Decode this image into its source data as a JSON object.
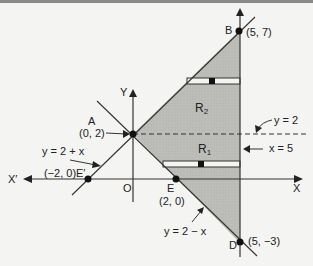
{
  "figure": {
    "axes": {
      "x_pos": "X",
      "x_neg": "X′",
      "y_pos": "Y",
      "origin": "O"
    },
    "points": {
      "A": {
        "name": "A",
        "coord": "(0, 2)"
      },
      "B": {
        "name": "B",
        "coord": "(5, 7)"
      },
      "D": {
        "name": "D",
        "coord": "(5, −3)"
      },
      "E": {
        "name": "E",
        "coord": "(2, 0)"
      },
      "E_prime": {
        "name": "E′",
        "coord": "(−2, 0)"
      }
    },
    "lines": {
      "l1": "y = 2 + x",
      "l2": "y = 2 − x",
      "l3": "x = 5",
      "l4": "y = 2"
    },
    "regions": {
      "R2": {
        "base": "R",
        "sub": "2"
      },
      "R1": {
        "base": "R",
        "sub": "1"
      }
    },
    "colors": {
      "shade": "#b9b9b6",
      "line": "#333333",
      "background": "#f4f4f2"
    }
  }
}
